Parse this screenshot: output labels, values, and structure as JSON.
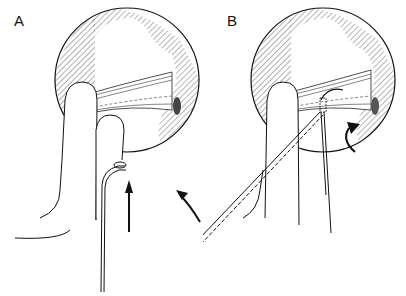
{
  "figure": {
    "panels": [
      {
        "label": "A",
        "elements": [
          "circular-view",
          "ligament-band",
          "index-finger",
          "middle-finger",
          "hook-instrument",
          "up-arrow",
          "curved-arrow"
        ]
      },
      {
        "label": "B",
        "elements": [
          "circular-view",
          "ligament-band",
          "finger",
          "suture-needle",
          "straight-instrument",
          "curved-arrow"
        ]
      }
    ],
    "colors": {
      "ink": "#111111",
      "background": "#ffffff",
      "hatch": "#333333"
    }
  }
}
